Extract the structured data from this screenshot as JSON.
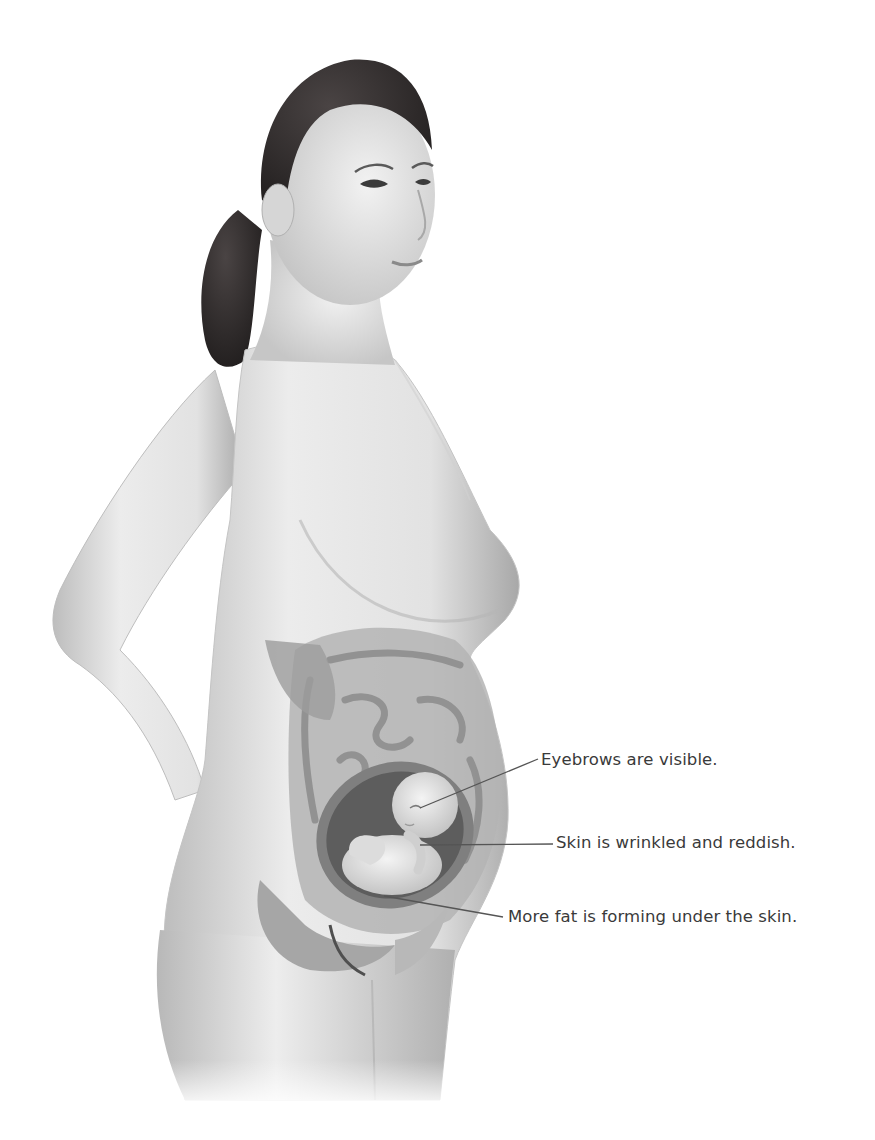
{
  "illustration": {
    "subject": "pregnant woman side view with fetus in uterus cutaway",
    "palette": {
      "background": "#ffffff",
      "skin_light": "#ececec",
      "skin_mid": "#cfcfcf",
      "skin_shadow": "#9a9a9a",
      "hair": "#2a2626",
      "organ": "#8d8d8d",
      "organ_dark": "#6a6a6a",
      "uterus_wall": "#7c7c7c",
      "fetus": "#e4e4e4",
      "leader_line": "#555555",
      "label_text": "#3a3a3a"
    }
  },
  "callouts": [
    {
      "label": "Eyebrows are visible.",
      "target": "fetus-face"
    },
    {
      "label": "Skin is wrinkled and reddish.",
      "target": "fetus-arm"
    },
    {
      "label": "More fat is forming under the skin.",
      "target": "fetus-body"
    }
  ]
}
